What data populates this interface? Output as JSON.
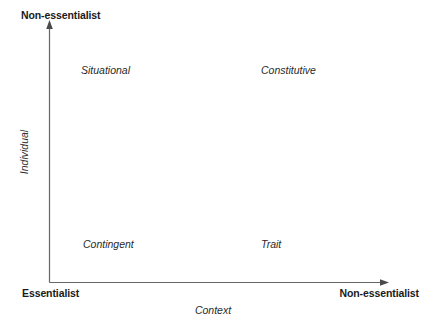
{
  "diagram": {
    "type": "2x2-quadrant",
    "background_color": "#ffffff",
    "axis_color": "#666666",
    "text_color": "#1a1a1a"
  },
  "axes": {
    "y": {
      "title": "Individual",
      "high_end_label": "Non-essentialist",
      "low_end_label": "Essentialist"
    },
    "x": {
      "title": "Context",
      "high_end_label": "Non-essentialist",
      "low_end_label": "Essentialist"
    }
  },
  "quadrants": [
    {
      "position": "upper-left",
      "label": "Situational"
    },
    {
      "position": "upper-right",
      "label": "Constitutive"
    },
    {
      "position": "lower-left",
      "label": "Contingent"
    },
    {
      "position": "lower-right",
      "label": "Trait"
    }
  ]
}
